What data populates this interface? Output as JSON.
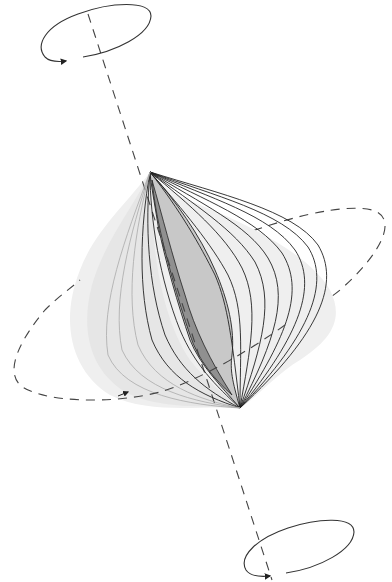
{
  "diagram": {
    "type": "3d-vortex-field-illustration",
    "elements": {
      "rotation_axis": {
        "style": "dashed",
        "from": [
          90,
          20
        ],
        "to": [
          272,
          580
        ]
      },
      "top_rotation_ring": {
        "center": [
          95,
          40
        ],
        "rx": 58,
        "ry": 22,
        "direction": "counterclockwise-arrow"
      },
      "bottom_rotation_ring": {
        "center": [
          305,
          547
        ],
        "rx": 52,
        "ry": 21,
        "direction": "counterclockwise-arrow"
      },
      "equatorial_orbit": {
        "style": "dashed",
        "direction-arrow": "left-to-right"
      },
      "field_surface": {
        "nested_layers": 14,
        "shading": [
          "#f0f0f0",
          "#e4e4e4",
          "#c8c8c8",
          "#9a9a9a"
        ]
      }
    },
    "colors": {
      "line": "#222222",
      "dash": "#444444",
      "shade_light": "#eeeeee",
      "shade_mid": "#c4c4c4",
      "shade_dark": "#8e8e8e"
    }
  }
}
